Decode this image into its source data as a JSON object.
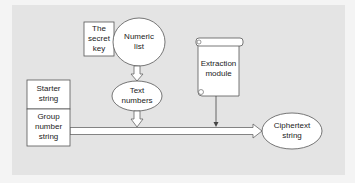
{
  "diagram": {
    "nodes": {
      "secret_key": {
        "label_lines": [
          "The",
          "secret",
          "key"
        ],
        "shape": "rectangle"
      },
      "numeric_list": {
        "label_lines": [
          "Numeric",
          "list"
        ],
        "shape": "ellipse"
      },
      "text_numbers": {
        "label_lines": [
          "Text",
          "numbers"
        ],
        "shape": "ellipse"
      },
      "starter_string": {
        "label_lines": [
          "Starter",
          "string"
        ],
        "shape": "rectangle"
      },
      "group_number_string": {
        "label_lines": [
          "Group",
          "number",
          "string"
        ],
        "shape": "rectangle"
      },
      "extraction_module": {
        "label_lines": [
          "Extraction",
          "module"
        ],
        "shape": "scroll"
      },
      "ciphertext_string": {
        "label_lines": [
          "Ciphertext",
          "string"
        ],
        "shape": "ellipse"
      }
    },
    "edges": [
      {
        "from": "numeric_list",
        "to": "text_numbers",
        "style": "hollow-arrow"
      },
      {
        "from": "text_numbers",
        "to": "main_flow",
        "style": "hollow-arrow"
      },
      {
        "from": "extraction_module",
        "to": "main_flow",
        "style": "thin-arrow"
      },
      {
        "from": "group_number_string",
        "to": "ciphertext_string",
        "style": "hollow-arrow"
      }
    ],
    "colors": {
      "background": "#e4e4e4",
      "shape_fill": "#ffffff",
      "stroke": "#555555",
      "text": "#222222"
    }
  }
}
